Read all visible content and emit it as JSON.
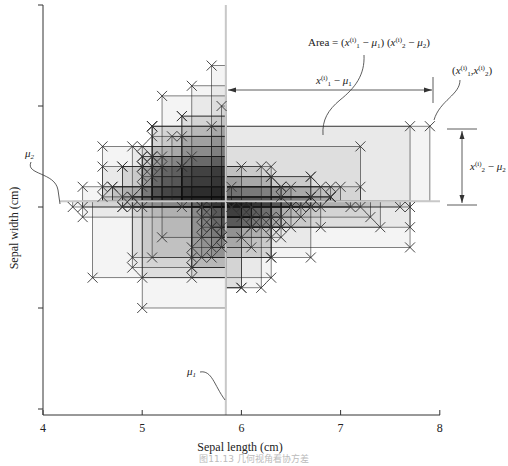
{
  "chart_data": {
    "type": "scatter",
    "title": "",
    "xlabel": "Sepal length (cm)",
    "ylabel": "Sepal width (cm)",
    "xlim": [
      4,
      8
    ],
    "ylim": [
      1,
      5
    ],
    "xticks": [
      4,
      5,
      6,
      7,
      8
    ],
    "xtick_labels": [
      "4",
      "5",
      "6",
      "7",
      "8"
    ],
    "yticks": [
      1,
      2,
      3,
      4,
      5
    ],
    "ytick_labels": [
      "",
      "",
      "",
      "",
      ""
    ],
    "grid": false,
    "legend": null,
    "means": {
      "mu1": 5.843,
      "mu2": 3.057
    },
    "mu1_label": "μ1",
    "mu2_label": "μ2",
    "marker": "x",
    "rectangles_to_mean": true,
    "annotations": {
      "area": "Area = (x1(i) − μ1) (x2(i) − μ2)",
      "dx": "x1(i) − μ1",
      "dy": "x2(i) − μ2",
      "point": "(x1(i), x2(i))"
    },
    "highlighted_point": [
      7.9,
      3.8
    ],
    "x": [
      5.1,
      4.9,
      4.7,
      4.6,
      5.0,
      5.4,
      4.6,
      5.0,
      4.4,
      4.9,
      5.4,
      4.8,
      4.8,
      4.3,
      5.8,
      5.7,
      5.4,
      5.1,
      5.7,
      5.1,
      5.4,
      5.1,
      4.6,
      5.1,
      4.8,
      5.0,
      5.0,
      5.2,
      5.2,
      4.7,
      4.8,
      5.4,
      5.2,
      5.5,
      4.9,
      5.0,
      5.5,
      4.9,
      4.4,
      5.1,
      5.0,
      4.5,
      4.4,
      5.0,
      5.1,
      4.8,
      5.1,
      4.6,
      5.3,
      5.0,
      7.0,
      6.4,
      6.9,
      5.5,
      6.5,
      5.7,
      6.3,
      4.9,
      6.6,
      5.2,
      5.0,
      5.9,
      6.0,
      6.1,
      5.6,
      6.7,
      5.6,
      5.8,
      6.2,
      5.6,
      5.9,
      6.1,
      6.3,
      6.1,
      6.4,
      6.6,
      6.8,
      6.7,
      6.0,
      5.7,
      5.5,
      5.5,
      5.8,
      6.0,
      5.4,
      6.0,
      6.7,
      6.3,
      5.6,
      5.5,
      5.5,
      6.1,
      5.8,
      5.0,
      5.6,
      5.7,
      5.7,
      6.2,
      5.1,
      5.7,
      6.3,
      5.8,
      7.1,
      6.3,
      6.5,
      7.6,
      4.9,
      7.3,
      6.7,
      7.2,
      6.5,
      6.4,
      6.8,
      5.7,
      5.8,
      6.4,
      6.5,
      7.7,
      7.7,
      6.0,
      6.9,
      5.6,
      7.7,
      6.3,
      6.7,
      7.2,
      6.2,
      6.1,
      6.4,
      7.2,
      7.4,
      7.9,
      6.4,
      6.3,
      6.1,
      7.7,
      6.3,
      6.4,
      6.0,
      6.9,
      6.7,
      6.9,
      5.8,
      6.8,
      6.7,
      6.7,
      6.3,
      6.5,
      6.2,
      5.9
    ],
    "y": [
      3.5,
      3.0,
      3.2,
      3.1,
      3.6,
      3.9,
      3.4,
      3.4,
      2.9,
      3.1,
      3.7,
      3.4,
      3.0,
      3.0,
      4.0,
      4.4,
      3.9,
      3.5,
      3.8,
      3.8,
      3.4,
      3.7,
      3.6,
      3.3,
      3.4,
      3.0,
      3.4,
      3.5,
      3.4,
      3.2,
      3.1,
      3.4,
      4.1,
      4.2,
      3.1,
      3.2,
      3.5,
      3.6,
      3.0,
      3.4,
      3.5,
      2.3,
      3.2,
      3.5,
      3.8,
      3.0,
      3.8,
      3.2,
      3.7,
      3.3,
      3.2,
      3.2,
      3.1,
      2.3,
      2.8,
      2.8,
      3.3,
      2.4,
      2.9,
      2.7,
      2.0,
      3.0,
      2.2,
      2.9,
      2.9,
      3.1,
      3.0,
      2.7,
      2.2,
      2.5,
      3.2,
      2.8,
      2.5,
      2.8,
      2.9,
      3.0,
      2.8,
      3.0,
      2.9,
      2.6,
      2.4,
      2.4,
      2.7,
      2.7,
      3.0,
      3.4,
      3.1,
      2.3,
      3.0,
      2.5,
      2.6,
      3.0,
      2.6,
      2.3,
      2.7,
      3.0,
      2.9,
      2.9,
      2.5,
      2.8,
      3.3,
      2.7,
      3.0,
      2.9,
      3.0,
      3.0,
      2.5,
      2.9,
      2.5,
      3.6,
      3.2,
      2.7,
      3.0,
      2.5,
      2.8,
      3.2,
      3.0,
      3.8,
      2.6,
      2.2,
      3.2,
      2.8,
      2.8,
      2.7,
      3.3,
      3.2,
      2.8,
      3.0,
      2.8,
      3.0,
      2.8,
      3.8,
      2.8,
      2.8,
      2.6,
      3.0,
      3.4,
      3.1,
      3.0,
      3.1,
      3.1,
      3.1,
      2.7,
      3.2,
      3.3,
      3.0,
      2.5,
      3.0,
      3.4,
      3.0
    ]
  },
  "caption": "图11.13  几何视角看协方差"
}
